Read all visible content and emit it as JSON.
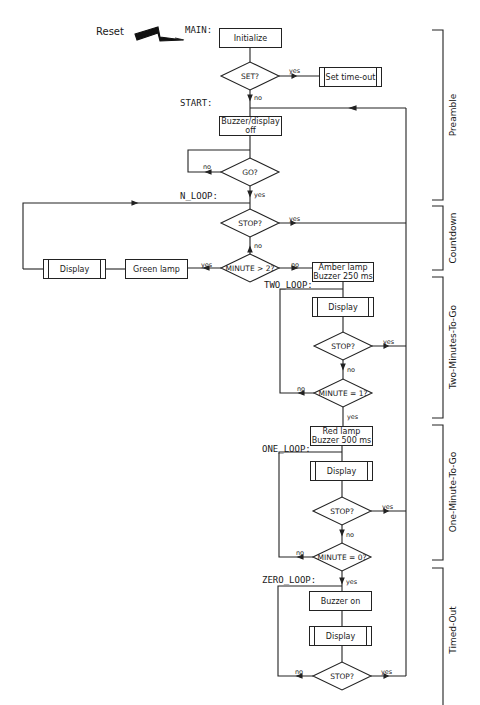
{
  "diagram": {
    "reset_label": "Reset",
    "labels": {
      "main": "MAIN:",
      "start": "START:",
      "n_loop": "N_LOOP:",
      "two_loop": "TWO_LOOP:",
      "one_loop": "ONE_LOOP:",
      "zero_loop": "ZERO_LOOP:"
    },
    "boxes": {
      "initialize": "Initialize",
      "set_timeout": "Set time-out",
      "buzzer_display_off": "Buzzer/display\noff",
      "green_lamp": "Green lamp",
      "display_countdown": "Display",
      "amber_lamp": "Amber lamp\nBuzzer 250 ms",
      "display_two": "Display",
      "red_lamp": "Red lamp\nBuzzer 500 ms",
      "display_one": "Display",
      "buzzer_on": "Buzzer on",
      "display_zero": "Display"
    },
    "decisions": {
      "set": "SET?",
      "go": "GO?",
      "stop_countdown": "STOP?",
      "minute_gt_2": "MINUTE > 2?",
      "stop_two": "STOP?",
      "minute_eq_1": "MINUTE = 1?",
      "stop_one": "STOP?",
      "minute_eq_0": "MINUTE = 0?",
      "stop_zero": "STOP?"
    },
    "branches": {
      "yes": "yes",
      "no": "no"
    },
    "sections": {
      "preamble": "Preamble",
      "countdown": "Countdown",
      "two_minutes": "Two-Minutes-To-Go",
      "one_minute": "One-Minute-To-Go",
      "timed_out": "Timed-Out"
    }
  }
}
